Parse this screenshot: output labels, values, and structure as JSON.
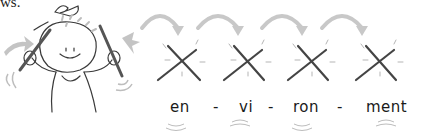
{
  "caption_fragment": "ws.",
  "illustration": {
    "figure": "cartoon-child-with-drumsticks",
    "colors": {
      "ink": "#3a3a3a",
      "accent_gray": "#bdbdbd"
    }
  },
  "syllables": [
    {
      "text": "en"
    },
    {
      "text": "vi"
    },
    {
      "text": "ron"
    },
    {
      "text": "ment"
    }
  ],
  "separator": "-",
  "beat_icon": "crossed-sticks-icon",
  "arrow_icon": "curved-arrow-icon"
}
